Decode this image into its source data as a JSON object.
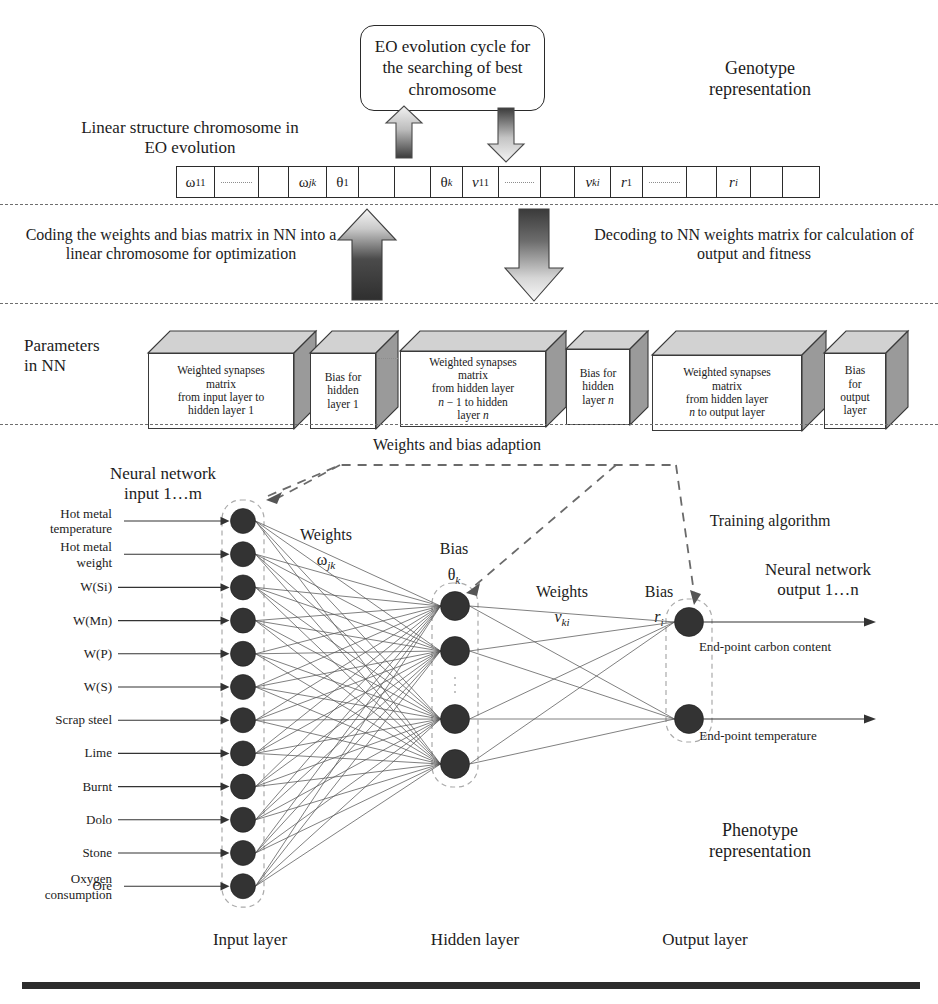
{
  "figure": {
    "title_eo_box": "EO evolution cycle for the searching of best chromosome",
    "genotype_label_line1": "Genotype",
    "genotype_label_line2": "representation",
    "phenotype_label_line1": "Phenotype",
    "phenotype_label_line2": "representation",
    "linear_structure_label_line1": "Linear structure chromosome in",
    "linear_structure_label_line2": "EO evolution",
    "coding_note": "Coding the weights and bias matrix in NN into a linear chromosome for optimization",
    "decoding_note": "Decoding to NN weights matrix for calculation of output and fitness",
    "parameters_label_line1": "Parameters",
    "parameters_label_line2": "in NN",
    "adaption_label": "Weights and bias adaption",
    "training_algorithm_label": "Training algorithm"
  },
  "chromosome": {
    "cells": [
      {
        "type": "label",
        "text": "ω11",
        "base": "ω",
        "sub": "11",
        "width": 38
      },
      {
        "type": "dots",
        "width": 44
      },
      {
        "type": "blank",
        "width": 30
      },
      {
        "type": "label",
        "text": "ωjk",
        "base": "ω",
        "sub": "jk",
        "width": 38
      },
      {
        "type": "label",
        "text": "θ1",
        "base": "θ",
        "sub": "1",
        "width": 32
      },
      {
        "type": "blank",
        "width": 36
      },
      {
        "type": "blank",
        "width": 36
      },
      {
        "type": "label",
        "text": "θk",
        "base": "θ",
        "sub": "k",
        "width": 32
      },
      {
        "type": "label",
        "text": "v11",
        "base": "v",
        "sub": "11",
        "width": 36
      },
      {
        "type": "dots",
        "width": 42
      },
      {
        "type": "blank",
        "width": 34
      },
      {
        "type": "label",
        "text": "vki",
        "base": "v",
        "sub": "ki",
        "width": 36
      },
      {
        "type": "label",
        "text": "r1",
        "base": "r",
        "sub": "1",
        "width": 32
      },
      {
        "type": "dots",
        "width": 44
      },
      {
        "type": "blank",
        "width": 30
      },
      {
        "type": "label",
        "text": "ri",
        "base": "r",
        "sub": "i",
        "width": 34
      },
      {
        "type": "blank",
        "width": 32
      },
      {
        "type": "blank",
        "width": 36
      }
    ]
  },
  "parameter_boxes": [
    {
      "lines": [
        "Weighted synapses",
        "matrix",
        "from input layer to",
        "hidden layer 1"
      ],
      "x": 148,
      "width": 146,
      "depth": 22
    },
    {
      "lines": [
        "Bias for",
        "hidden",
        "layer 1"
      ],
      "x": 310,
      "width": 66,
      "depth": 22
    },
    {
      "lines": [
        "Weighted synapses",
        "matrix",
        "from hidden layer",
        "n − 1 to hidden",
        "layer n"
      ],
      "x": 400,
      "width": 146,
      "depth": 20
    },
    {
      "lines": [
        "Bias for",
        "hidden",
        "layer n"
      ],
      "x": 566,
      "width": 64,
      "depth": 18
    },
    {
      "lines": [
        "Weighted synapses",
        "matrix",
        "from hidden layer",
        "n to output layer"
      ],
      "x": 652,
      "width": 150,
      "depth": 24
    },
    {
      "lines": [
        "Bias",
        "for",
        "output",
        "layer"
      ],
      "x": 824,
      "width": 62,
      "depth": 22
    }
  ],
  "network": {
    "input_heading_line1": "Neural network",
    "input_heading_line2": "input 1…m",
    "output_heading_line1": "Neural network",
    "output_heading_line2": "output 1…n",
    "inputs": [
      "Hot metal temperature",
      "Hot metal weight",
      "W(Si)",
      "W(Mn)",
      "W(P)",
      "W(S)",
      "Scrap steel",
      "Lime",
      "Burnt",
      "Dolo",
      "Stone",
      "Ore",
      "Oxygen consumption"
    ],
    "outputs": [
      "End-point carbon content",
      "End-point temperature"
    ],
    "weights_label_1": "Weights",
    "weights_symbol_1": "ωjk",
    "bias_label_1": "Bias",
    "bias_symbol_1": "θk",
    "weights_label_2": "Weights",
    "weights_symbol_2": "vki",
    "bias_label_2": "Bias",
    "bias_symbol_2": "ri",
    "layer_labels": [
      "Input layer",
      "Hidden layer",
      "Output layer"
    ],
    "input_node_count": 12,
    "hidden_node_count": 4,
    "output_node_count": 2
  },
  "colors": {
    "ink": "#1c1c1c",
    "node_fill": "#333333",
    "synapse": "#555555",
    "dashed_group": "#aaaaaa",
    "separator": "#6e6e6e",
    "box_fill_top": "#d2d2d2",
    "box_fill_side": "#9a9a9a",
    "rule": "#2c2c2c"
  }
}
